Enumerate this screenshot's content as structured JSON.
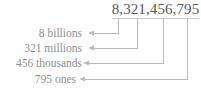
{
  "diagram": {
    "type": "place-value-decomposition",
    "number": "8,321,456,795",
    "number_color": "#58595b",
    "label_color": "#8d8f92",
    "line_color": "#b9bbbe",
    "background_color": "#ffffff",
    "labels": [
      {
        "id": "billions",
        "text": "8 billions"
      },
      {
        "id": "millions",
        "text": "321 millions"
      },
      {
        "id": "thousands",
        "text": "456 thousands"
      },
      {
        "id": "ones",
        "text": "795 ones"
      }
    ],
    "connectors": [
      {
        "from_digit_group": "8",
        "to_label": "8 billions",
        "tick_x": 118,
        "arrow_y": 33
      },
      {
        "from_digit_group": "321",
        "to_label": "321 millions",
        "tick_x": 137,
        "arrow_y": 48
      },
      {
        "from_digit_group": "456",
        "to_label": "456 thousands",
        "tick_x": 163,
        "arrow_y": 63
      },
      {
        "from_digit_group": "795",
        "to_label": "795 ones",
        "tick_x": 187,
        "arrow_y": 79
      }
    ]
  }
}
